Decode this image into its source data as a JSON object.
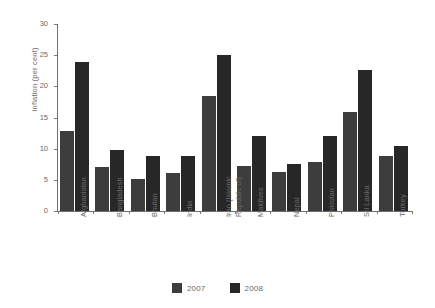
{
  "chart_data": {
    "type": "bar",
    "title": "",
    "subtitle": "",
    "xlabel": "",
    "ylabel": "Inflation  (per cent)",
    "ylim": [
      0,
      30
    ],
    "ytick_values": [
      0,
      5,
      10,
      15,
      20,
      25,
      30
    ],
    "ytick_labels": [
      "0",
      "5",
      "10",
      "15",
      "20",
      "25",
      "30"
    ],
    "grid": false,
    "legend_position": "bottom-center",
    "categories": [
      "Afghanistan",
      "Bangladesh",
      "Bhutan",
      "India",
      "Iran (Islamic\nRepublic of)",
      "Maldives",
      "Nepal",
      "Pakistan",
      "Sri Lanka",
      "Turkey"
    ],
    "series": [
      {
        "name": "2007",
        "color": "#3d3d3d",
        "values": [
          12.9,
          7.1,
          5.1,
          6.1,
          18.4,
          7.3,
          6.3,
          7.8,
          15.9,
          8.8
        ]
      },
      {
        "name": "2008",
        "color": "#272727",
        "values": [
          23.9,
          9.8,
          8.9,
          8.9,
          25.0,
          12.0,
          7.6,
          12.0,
          22.6,
          10.4
        ]
      }
    ]
  },
  "legend": {
    "items": [
      {
        "label": "2007",
        "color": "#3d3d3d"
      },
      {
        "label": "2008",
        "color": "#272727"
      }
    ]
  }
}
